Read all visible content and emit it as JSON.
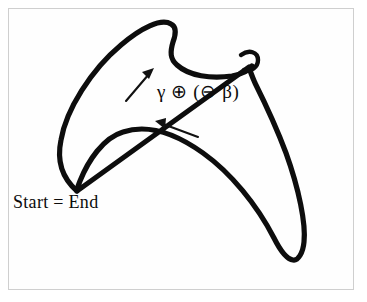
{
  "figure": {
    "name": "closed-curve-diagram",
    "background_color": "#ffffff",
    "frame_border_color": "#cfcfcf",
    "stroke_color": "#0d0d0d",
    "labels": {
      "operation": "γ ⊕ (⊖ β)",
      "start_end": "Start = End"
    },
    "annotations": {
      "arrow_upper": {
        "name": "direction-arrow-upper",
        "direction": "up-right",
        "from": [
          126,
          101
        ],
        "to": [
          153,
          70
        ]
      },
      "arrow_lower": {
        "name": "direction-arrow-lower",
        "direction": "left",
        "from": [
          197,
          137
        ],
        "to": [
          157,
          122
        ]
      }
    },
    "curve": {
      "type": "closed-loop",
      "cusps": [
        {
          "name": "top-cusp",
          "point": [
            170,
            24
          ]
        },
        {
          "name": "right-small-loop",
          "point": [
            253,
            59
          ]
        },
        {
          "name": "bottom-left-cusp",
          "point": [
            76,
            190
          ]
        },
        {
          "name": "bottom-right-cusp",
          "point": [
            292,
            259
          ]
        }
      ],
      "outline_path": "M 76 190 C 62 176 59 160 62 142 C 66 112 90 72 120 46 C 140 29 160 19 170 24 C 175 26 174 33 172 40 C 169 50 168 58 174 64 C 184 74 205 78 228 76 C 240 75 248 72 251 66",
      "outline_path_2": "M 251 66 C 254 58 250 53 245 54 C 240 55 239 61 243 68 C 252 86 268 122 281 156 C 296 195 305 230 303 246 C 302 255 297 260 292 259 C 286 258 280 248 274 236 C 258 204 232 172 204 152 C 176 132 148 124 124 131 C 104 137 88 160 79 180 C 77 185 76 188 76 190 Z",
      "loop_path": "M 240 54 C 248 50 256 53 256 60 C 256 67 249 71 243 69"
    }
  }
}
